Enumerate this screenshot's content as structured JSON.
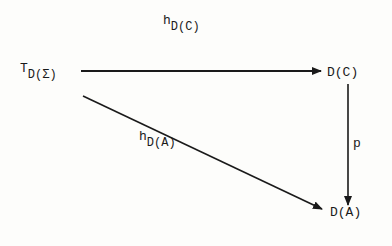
{
  "nodes": {
    "source": {
      "main": "T",
      "sub": "D(Σ)"
    },
    "top_right": {
      "label": "D(C)"
    },
    "bottom_right": {
      "label": "D(A)"
    }
  },
  "arrows": {
    "top": {
      "main": "h",
      "sub": "D(C)",
      "from": "T_D(Σ)",
      "to": "D(C)"
    },
    "right": {
      "label": "p",
      "from": "D(C)",
      "to": "D(A)"
    },
    "diagonal": {
      "main": "h",
      "sub": "D(A)",
      "from": "T_D(Σ)",
      "to": "D(A)"
    }
  }
}
